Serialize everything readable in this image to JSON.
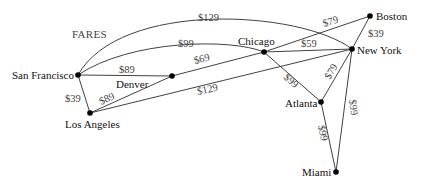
{
  "diagram": {
    "title": "FARES",
    "colors": {
      "line": "#2b2b2b",
      "node": "#000000",
      "city_text": "#111111",
      "fare_text": "#444444"
    },
    "nodes": [
      {
        "id": "sf",
        "label": "San Francisco"
      },
      {
        "id": "la",
        "label": "Los Angeles"
      },
      {
        "id": "denver",
        "label": "Denver"
      },
      {
        "id": "chicago",
        "label": "Chicago"
      },
      {
        "id": "boston",
        "label": "Boston"
      },
      {
        "id": "newyork",
        "label": "New York"
      },
      {
        "id": "atlanta",
        "label": "Atlanta"
      },
      {
        "id": "miami",
        "label": "Miami"
      }
    ],
    "edges": [
      {
        "from": "San Francisco",
        "to": "New York",
        "fare": "$129"
      },
      {
        "from": "San Francisco",
        "to": "Chicago",
        "fare": "$99"
      },
      {
        "from": "San Francisco",
        "to": "Denver",
        "fare": "$89"
      },
      {
        "from": "San Francisco",
        "to": "Los Angeles",
        "fare": "$39"
      },
      {
        "from": "Los Angeles",
        "to": "Denver",
        "fare": "$89"
      },
      {
        "from": "Los Angeles",
        "to": "New York",
        "fare": "$129"
      },
      {
        "from": "Denver",
        "to": "Chicago",
        "fare": "$69"
      },
      {
        "from": "Chicago",
        "to": "Boston",
        "fare": "$79"
      },
      {
        "from": "Chicago",
        "to": "New York",
        "fare": "$59"
      },
      {
        "from": "Chicago",
        "to": "Atlanta",
        "fare": "$99"
      },
      {
        "from": "Boston",
        "to": "New York",
        "fare": "$39"
      },
      {
        "from": "New York",
        "to": "Atlanta",
        "fare": "$79"
      },
      {
        "from": "New York",
        "to": "Miami",
        "fare": "$99"
      },
      {
        "from": "Atlanta",
        "to": "Miami",
        "fare": "$99"
      }
    ]
  }
}
